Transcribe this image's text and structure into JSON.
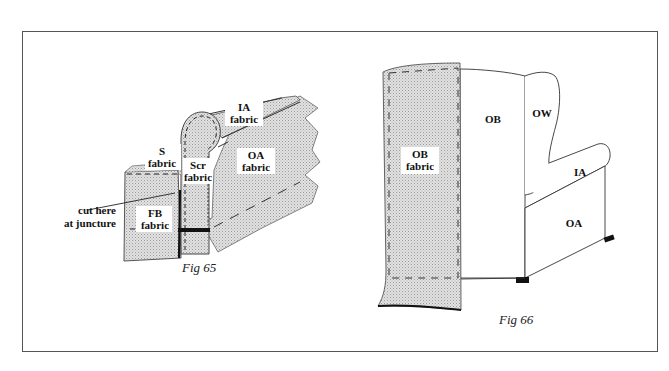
{
  "figures": [
    {
      "id": "fig65",
      "caption": "Fig 65",
      "labels": {
        "ia": [
          "IA",
          "fabric"
        ],
        "s": [
          "S",
          "fabric"
        ],
        "scr": [
          "Scr",
          "fabric"
        ],
        "oa": [
          "OA",
          "fabric"
        ],
        "fb": [
          "FB",
          "fabric"
        ],
        "callout": [
          "cut here",
          "at juncture"
        ]
      }
    },
    {
      "id": "fig66",
      "caption": "Fig 66",
      "labels": {
        "ob_fabric": [
          "OB",
          "fabric"
        ],
        "ob": "OB",
        "ow": "OW",
        "ia": "IA",
        "oa": "OA"
      }
    }
  ],
  "colors": {
    "fabric_fill": "#d6d6d6",
    "line": "#333333",
    "frame": "#555555",
    "seam_tape": "#111111"
  }
}
